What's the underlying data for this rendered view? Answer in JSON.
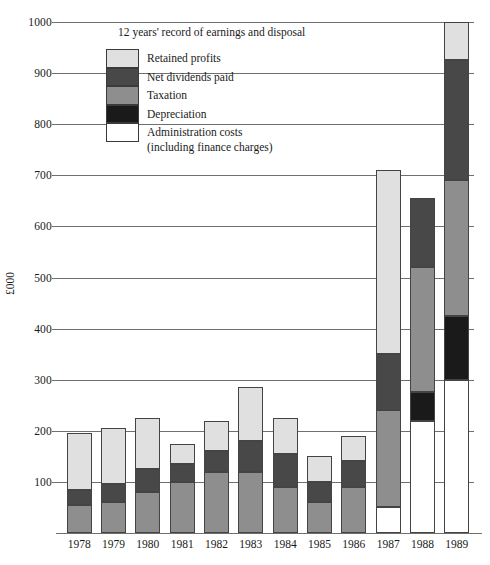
{
  "chart_data": {
    "type": "bar",
    "subtype": "stacked-vertical",
    "title": "12 years' record of earnings and disposal",
    "xlabel": "",
    "ylabel": "£000",
    "ylim": [
      0,
      1000
    ],
    "ytick_step": 100,
    "yticks": [
      0,
      100,
      200,
      300,
      400,
      500,
      600,
      700,
      800,
      900,
      1000
    ],
    "ytick_labels": [
      "",
      "100",
      "200",
      "300",
      "400",
      "500",
      "600",
      "700",
      "800",
      "900",
      "1000"
    ],
    "grid": "horizontal",
    "legend_position": "upper-left-inside",
    "categories": [
      "1978",
      "1979",
      "1980",
      "1981",
      "1982",
      "1983",
      "1984",
      "1985",
      "1986",
      "1987",
      "1988",
      "1989"
    ],
    "stack_order_bottom_to_top": [
      "Administration costs (including finance charges)",
      "Depreciation",
      "Taxation",
      "Net dividends paid",
      "Retained profits"
    ],
    "series": [
      {
        "name": "Administration costs (including finance charges)",
        "color": "#ffffff",
        "values": [
          0,
          0,
          0,
          0,
          0,
          0,
          0,
          0,
          0,
          50,
          220,
          300
        ]
      },
      {
        "name": "Depreciation",
        "color": "#1a1a1a",
        "values": [
          0,
          0,
          0,
          0,
          0,
          0,
          0,
          0,
          0,
          0,
          55,
          125
        ]
      },
      {
        "name": "Taxation",
        "color": "#8e8e8e",
        "values": [
          55,
          60,
          80,
          100,
          120,
          120,
          90,
          60,
          90,
          190,
          245,
          265
        ]
      },
      {
        "name": "Net dividends paid",
        "color": "#484848",
        "values": [
          30,
          35,
          45,
          35,
          40,
          60,
          65,
          40,
          50,
          110,
          135,
          235
        ]
      },
      {
        "name": "Retained profits",
        "color": "#e0e0e0",
        "values": [
          110,
          110,
          100,
          40,
          60,
          105,
          70,
          50,
          50,
          360,
          0,
          75
        ]
      }
    ],
    "totals": [
      195,
      205,
      225,
      175,
      220,
      285,
      225,
      150,
      190,
      710,
      655,
      1000
    ]
  },
  "legend": {
    "items": [
      {
        "label": "Retained profits",
        "sublabel": "",
        "color": "#e0e0e0"
      },
      {
        "label": "Net dividends paid",
        "sublabel": "",
        "color": "#484848"
      },
      {
        "label": "Taxation",
        "sublabel": "",
        "color": "#8e8e8e"
      },
      {
        "label": "Depreciation",
        "sublabel": "",
        "color": "#1a1a1a"
      },
      {
        "label": "Administration costs",
        "sublabel": "(including finance charges)",
        "color": "#ffffff"
      }
    ]
  },
  "colors": {
    "retained_profits": "#e0e0e0",
    "net_dividends_paid": "#484848",
    "taxation": "#8e8e8e",
    "depreciation": "#1a1a1a",
    "administration_costs": "#ffffff",
    "grid": "#6f6f6f",
    "outline": "#444444",
    "text": "#1a1a1a",
    "background": "#ffffff"
  }
}
